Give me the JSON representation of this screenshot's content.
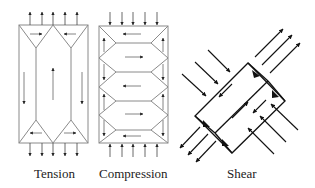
{
  "panels": [
    {
      "id": "tension",
      "label": "Tension"
    },
    {
      "id": "compression",
      "label": "Compression"
    },
    {
      "id": "shear",
      "label": "Shear"
    }
  ],
  "colors": {
    "line": "#8a8a8a",
    "arrow": "#222222",
    "shear": "#111111"
  }
}
